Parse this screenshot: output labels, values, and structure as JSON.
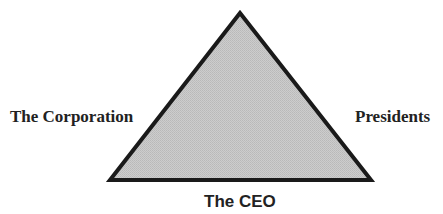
{
  "diagram": {
    "type": "triangle",
    "vertices": {
      "apex": [
        240,
        13
      ],
      "bottom_left": [
        110,
        180
      ],
      "bottom_right": [
        371,
        180
      ]
    },
    "fill_color": "#c6c6c6",
    "stroke_color": "#1a1a1a",
    "stroke_width": 4,
    "labels": {
      "left": "The Corporation",
      "right": "Presidents",
      "bottom": "The CEO"
    }
  }
}
